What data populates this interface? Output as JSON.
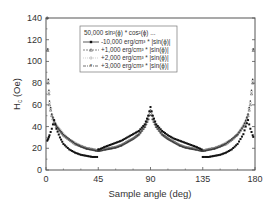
{
  "chart_data": {
    "type": "scatter",
    "title": "",
    "xlabel": "Sample angle (deg)",
    "ylabel": "H_c (Oe)",
    "xlim": [
      0,
      180
    ],
    "ylim": [
      0,
      140
    ],
    "xticks": [
      0,
      45,
      90,
      135,
      180
    ],
    "yticks": [
      0,
      20,
      40,
      60,
      80,
      100,
      120,
      140
    ],
    "grid": false,
    "legend_position": "upper center (inside)",
    "legend_title": "50,000 sin²(ϕ) * cos²(ϕ) ...",
    "x": [
      1,
      2,
      3,
      5,
      7,
      9,
      12,
      15,
      20,
      25,
      30,
      35,
      40,
      44,
      46,
      50,
      55,
      60,
      65,
      70,
      75,
      80,
      85,
      88,
      90,
      92,
      95,
      100,
      105,
      110,
      115,
      120,
      125,
      130,
      134,
      136,
      140,
      145,
      150,
      155,
      160,
      165,
      170,
      172,
      174,
      176,
      178,
      179
    ],
    "series": [
      {
        "name": "-10,000 erg/cm³ * |sin(ϕ)|",
        "marker": "filled square",
        "color": "#111111",
        "values": [
          27,
          29,
          32,
          38,
          46,
          38,
          30,
          24,
          19,
          16,
          14,
          13,
          12,
          12,
          19,
          21,
          23,
          25,
          27,
          30,
          33,
          36,
          42,
          50,
          58,
          50,
          42,
          36,
          32,
          29,
          27,
          25,
          23,
          21,
          19,
          12,
          12,
          13,
          14,
          16,
          19,
          24,
          33,
          40,
          46,
          38,
          32,
          29
        ]
      },
      {
        "name": "+1,000 erg/cm³ * |sin(ϕ)|",
        "marker": "open triangle",
        "color": "#555555",
        "values": [
          140,
          80,
          60,
          50,
          44,
          40,
          36,
          32,
          28,
          24,
          22,
          20,
          19,
          18,
          18,
          19,
          20,
          21,
          23,
          26,
          29,
          33,
          40,
          47,
          55,
          47,
          40,
          33,
          29,
          26,
          23,
          21,
          20,
          19,
          18,
          18,
          19,
          20,
          22,
          24,
          28,
          33,
          40,
          44,
          50,
          60,
          80,
          140
        ]
      },
      {
        "name": "+2,000 erg/cm³ * |sin(ϕ)|",
        "marker": "open circle",
        "color": "#aaaaaa",
        "values": [
          140,
          82,
          62,
          51,
          45,
          41,
          37,
          33,
          28,
          25,
          22,
          20,
          19,
          18,
          18,
          19,
          20,
          21,
          23,
          26,
          29,
          33,
          40,
          47,
          54,
          47,
          40,
          33,
          29,
          26,
          23,
          21,
          20,
          19,
          18,
          18,
          19,
          20,
          22,
          25,
          28,
          33,
          41,
          45,
          51,
          62,
          82,
          140
        ]
      },
      {
        "name": "+3,000 erg/cm³ * |sin(ϕ)|",
        "marker": "star",
        "color": "#333333",
        "values": [
          140,
          84,
          64,
          52,
          46,
          41,
          37,
          33,
          29,
          25,
          22,
          20,
          19,
          18,
          18,
          19,
          20,
          21,
          23,
          26,
          29,
          33,
          40,
          47,
          54,
          47,
          40,
          33,
          29,
          26,
          23,
          21,
          20,
          19,
          18,
          18,
          19,
          20,
          22,
          25,
          29,
          33,
          41,
          46,
          52,
          64,
          84,
          140
        ]
      }
    ]
  },
  "axes": {
    "xlabel": "Sample angle (deg)",
    "ylabel_main": "H",
    "ylabel_sub": "c",
    "ylabel_unit": " (Oe)",
    "xtick_labels": [
      "0",
      "45",
      "90",
      "135",
      "180"
    ],
    "ytick_labels": [
      "0",
      "20",
      "40",
      "60",
      "80",
      "100",
      "120",
      "140"
    ]
  },
  "legend": {
    "title": "50,000 sin²(ϕ) * cos²(ϕ) ...",
    "entries": [
      "-10,000 erg/cm³ * |sin(ϕ)|",
      "+1,000 erg/cm³ * |sin(ϕ)|",
      "+2,000 erg/cm³ * |sin(ϕ)|",
      "+3,000 erg/cm³ * |sin(ϕ)|"
    ]
  }
}
